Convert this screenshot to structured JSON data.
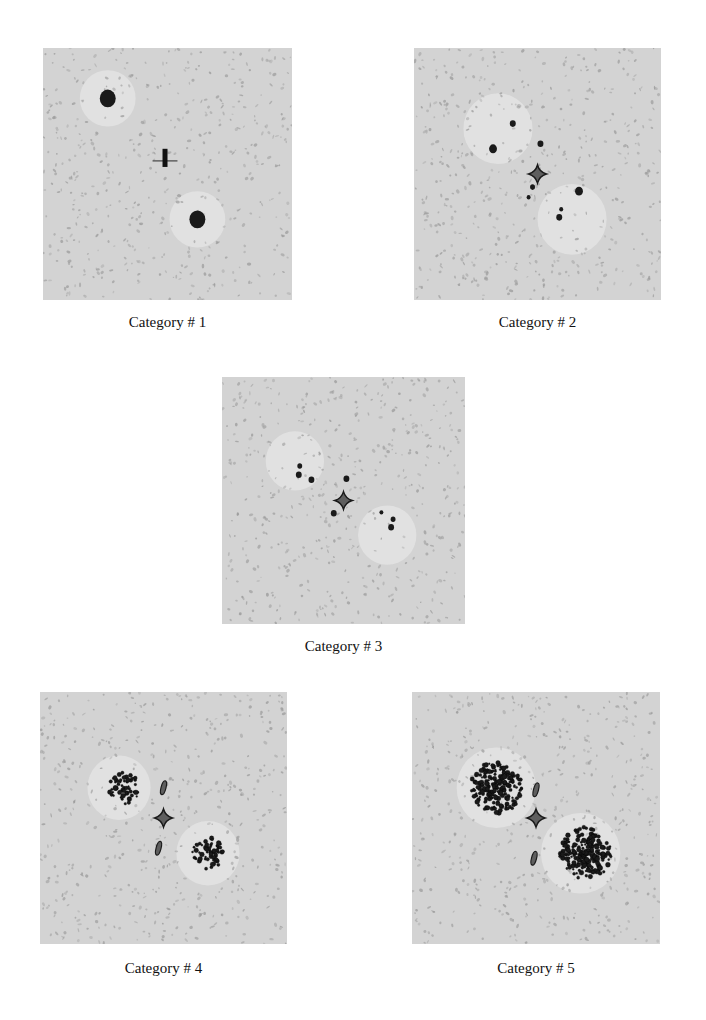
{
  "figure": {
    "panels": [
      {
        "id": "p1",
        "caption": "Category # 1",
        "center_marker": "cross",
        "cluster_density": "single-blob"
      },
      {
        "id": "p2",
        "caption": "Category # 2",
        "center_marker": "diamond",
        "cluster_density": "sparse"
      },
      {
        "id": "p3",
        "caption": "Category # 3",
        "center_marker": "diamond",
        "cluster_density": "sparse"
      },
      {
        "id": "p4",
        "caption": "Category # 4",
        "center_marker": "diamond",
        "cluster_density": "medium"
      },
      {
        "id": "p5",
        "caption": "Category # 5",
        "center_marker": "diamond",
        "cluster_density": "dense"
      }
    ],
    "colors": {
      "background": "#d3d3d3",
      "speckle": "#9a9a9a",
      "halo": "#e6e6e6",
      "cluster": "#1a1a1a",
      "diamond": "#5e5e5e"
    }
  }
}
